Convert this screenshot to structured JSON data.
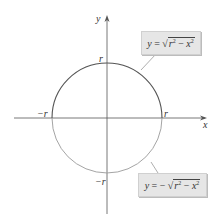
{
  "diagram": {
    "type": "circle-graph",
    "center": [
      0,
      0
    ],
    "radius_label": "r",
    "axes": {
      "x_label": "x",
      "y_label": "y"
    },
    "intercepts": {
      "x_pos": "r",
      "x_neg": "−r",
      "y_pos": "r",
      "y_neg": "−r"
    },
    "upper_curve": {
      "equation": "y = √(r² − x²)",
      "parts": {
        "lhs": "y",
        "eq": " = ",
        "sign": "",
        "sqrt_r": "r",
        "sqrt_r_exp": "2",
        "minus": " − ",
        "sqrt_x": "x",
        "sqrt_x_exp": "2"
      },
      "color": "#555555"
    },
    "lower_curve": {
      "equation": "y = −√(r² − x²)",
      "parts": {
        "lhs": "y",
        "eq": " = ",
        "sign": "− ",
        "sqrt_r": "r",
        "sqrt_r_exp": "2",
        "minus": " − ",
        "sqrt_x": "x",
        "sqrt_x_exp": "2"
      },
      "color": "#9a9a9a"
    },
    "colors": {
      "axis": "#555555",
      "label_box": "#e6e6e6"
    }
  }
}
